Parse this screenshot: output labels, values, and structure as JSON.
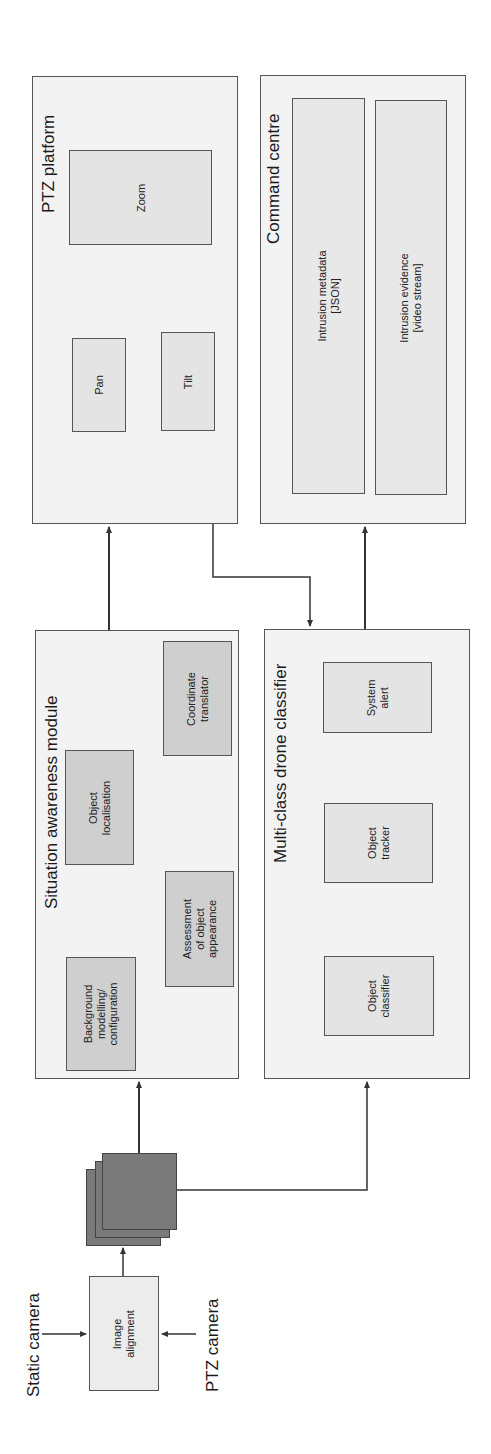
{
  "inputs": {
    "static_camera": "Static camera",
    "ptz_camera": "PTZ camera"
  },
  "image_alignment": {
    "label": "Image\nalignment"
  },
  "frame_stack": {
    "icon": "image-frames-stack-icon"
  },
  "situation_awareness": {
    "title": "Situation awareness module",
    "blocks": [
      {
        "label": "Background\nmodelling/\nconfiguration"
      },
      {
        "label": "Assessment\nof object\nappearance"
      },
      {
        "label": "Object\nlocalisation"
      },
      {
        "label": "Coordinate\ntranslator"
      }
    ]
  },
  "multi_class": {
    "title": "Multi-class drone classifier",
    "blocks": [
      {
        "label": "Object\nclassifier"
      },
      {
        "label": "Object\ntracker"
      },
      {
        "label": "System\nalert"
      }
    ]
  },
  "ptz_platform": {
    "title": "PTZ platform",
    "blocks": [
      {
        "label": "Pan"
      },
      {
        "label": "Tilt"
      },
      {
        "label": "Zoom"
      }
    ]
  },
  "command_centre": {
    "title": "Command centre",
    "blocks": [
      {
        "label": "Intrusion metadata\n[JSON]"
      },
      {
        "label": "Intrusion evidence\n[video stream]"
      }
    ]
  },
  "colors": {
    "outer_fill": "#f3f3f3",
    "inner_fill": "#cfcfcf",
    "frame_fill": "#7a7a7a",
    "line": "#333333"
  }
}
